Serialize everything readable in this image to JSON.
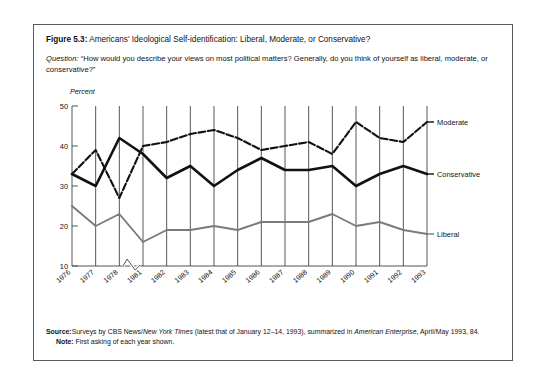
{
  "figure": {
    "number_label": "Figure 5.3:",
    "title_text": "Americans' Ideological Self-identification: Liberal, Moderate, or Conservative?",
    "question_label": "Question:",
    "question_text": "“How would you describe your views on most political matters? Generally, do you think of yourself as liberal, moderate, or conservative?”"
  },
  "footer": {
    "source_label": "Source:",
    "source_text_1": "Surveys by CBS News/",
    "source_italic_1": "New York Times",
    "source_text_2": " (latest that of January 12–14, 1993), summarized in ",
    "source_italic_2": "American Enterprise",
    "source_text_3": ", April/May 1993, 84.",
    "note_label": "Note:",
    "note_text": "First asking of each year shown."
  },
  "chart_data": {
    "type": "line",
    "title": "Americans' Ideological Self-identification: Liberal, Moderate, or Conservative?",
    "xlabel": "",
    "ylabel": "Percent",
    "ylim": [
      10,
      50
    ],
    "yticks": [
      10,
      20,
      30,
      40,
      50
    ],
    "ytick_labels": [
      "10",
      "20",
      "30",
      "40",
      "50"
    ],
    "grid": "vertical-only",
    "legend_position": "right-of-plot-end-labels",
    "axis_break_between": [
      "1978",
      "1981"
    ],
    "categories": [
      "1976",
      "1977",
      "1978",
      "1981",
      "1982",
      "1983",
      "1984",
      "1985",
      "1986",
      "1987",
      "1988",
      "1989",
      "1990",
      "1991",
      "1992",
      "1993"
    ],
    "series": [
      {
        "name": "Moderate",
        "style": "dashed",
        "color": "#111111",
        "values": [
          33,
          39,
          27,
          40,
          41,
          43,
          44,
          42,
          39,
          40,
          41,
          38,
          46,
          42,
          41,
          46
        ]
      },
      {
        "name": "Conservative",
        "style": "solid-thick",
        "color": "#111111",
        "values": [
          33,
          30,
          42,
          38,
          32,
          35,
          30,
          34,
          37,
          34,
          34,
          35,
          30,
          33,
          35,
          33
        ]
      },
      {
        "name": "Liberal",
        "style": "solid",
        "color": "#7a7a7a",
        "values": [
          25,
          20,
          23,
          16,
          19,
          19,
          20,
          19,
          21,
          21,
          21,
          23,
          20,
          21,
          19,
          18
        ]
      }
    ]
  }
}
